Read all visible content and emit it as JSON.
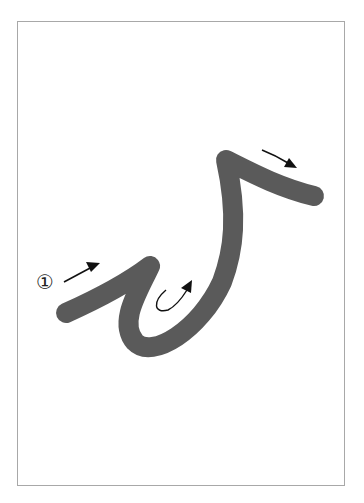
{
  "page": {
    "top_text_fragment": "",
    "frame_border_color": "#a8a8a8"
  },
  "diagram": {
    "type": "stroke-order",
    "stroke_color": "#5a5a5a",
    "arrow_color": "#111111",
    "step_marker": "①",
    "strokes": [
      {
        "id": 1,
        "description": "single continuous stroke: rises up-right, hooks down into a loop, sweeps up to a peak, then turns right"
      }
    ],
    "arrows": [
      {
        "id": "arrow-1",
        "direction": "up-right",
        "position": "left of first segment"
      },
      {
        "id": "arrow-2",
        "direction": "curved hook up-right",
        "position": "inside loop"
      },
      {
        "id": "arrow-3",
        "direction": "down-right",
        "position": "above final segment"
      }
    ]
  }
}
